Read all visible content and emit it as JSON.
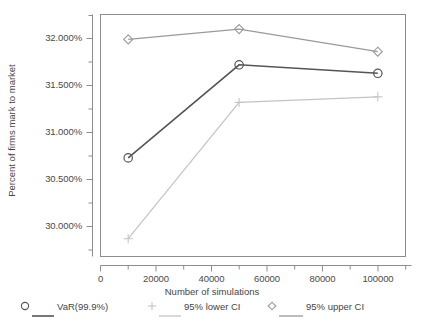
{
  "chart_data": {
    "type": "line",
    "title": "",
    "xlabel": "Number of simulations",
    "ylabel": "Percent of firms mark to market",
    "x": [
      10000,
      50000,
      100000
    ],
    "xlim": [
      0,
      110000
    ],
    "ylim": [
      29.78,
      32.22
    ],
    "grid": false,
    "legend_position": "bottom",
    "xticks": [
      0,
      20000,
      40000,
      60000,
      80000,
      100000
    ],
    "xticklabels": [
      "0",
      "20000",
      "40000",
      "60000",
      "80000",
      "100000"
    ],
    "xminorticks": [
      10000,
      30000,
      50000,
      70000,
      90000,
      110000
    ],
    "yticks": [
      30.0,
      30.5,
      31.0,
      31.5,
      32.0
    ],
    "yticklabels": [
      "30.000%",
      "30.500%",
      "31.000%",
      "31.500%",
      "32.000%"
    ],
    "yminorticks": [
      29.75,
      30.25,
      30.75,
      31.25,
      31.75,
      32.25
    ],
    "series": [
      {
        "name": "VaR(99.9%)",
        "marker": "circle",
        "color": "#555555",
        "values": [
          30.73,
          31.72,
          31.63
        ]
      },
      {
        "name": "95% lower CI",
        "marker": "plus",
        "color": "#c4c4c4",
        "values": [
          29.87,
          31.32,
          31.38
        ]
      },
      {
        "name": "95% upper CI",
        "marker": "diamond",
        "color": "#9a9a9a",
        "values": [
          31.99,
          32.1,
          31.86
        ]
      }
    ]
  },
  "legend": {
    "items": [
      {
        "label": "VaR(99.9%)",
        "marker": "circle-marker-icon",
        "color": "#555555"
      },
      {
        "label": "95% lower CI",
        "marker": "plus-marker-icon",
        "color": "#c4c4c4"
      },
      {
        "label": "95% upper CI",
        "marker": "diamond-marker-icon",
        "color": "#9a9a9a"
      }
    ]
  },
  "axes": {
    "x_title": "Number of simulations",
    "y_title": "Percent of firms mark to market",
    "x_tick_labels": [
      "0",
      "20000",
      "40000",
      "60000",
      "80000",
      "100000"
    ],
    "y_tick_labels": [
      "30.000%",
      "30.500%",
      "31.000%",
      "31.500%",
      "32.000%"
    ]
  },
  "colors": {
    "frame": "#8d8d8d",
    "text": "#4a4a4a",
    "var_series": "#555555",
    "lower_ci_series": "#c4c4c4",
    "upper_ci_series": "#9a9a9a",
    "background": "#ffffff"
  }
}
